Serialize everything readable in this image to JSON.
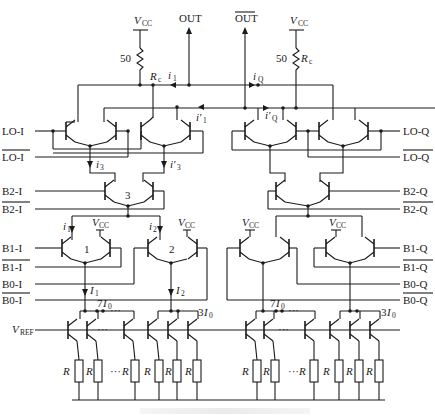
{
  "diagram": {
    "type": "circuit-schematic",
    "supply": {
      "label": "V",
      "sub": "CC"
    },
    "load_resistors": [
      {
        "side": "I",
        "value": "50",
        "name": "R",
        "sub": "c"
      },
      {
        "side": "Q",
        "value": "50",
        "name": "R",
        "sub": "c"
      }
    ],
    "outputs": {
      "out": "OUT",
      "out_bar": "OUT"
    },
    "currents": {
      "i1": {
        "base": "i",
        "sub": "1"
      },
      "i1p": {
        "base": "i′",
        "sub": "1"
      },
      "iQ": {
        "base": "i",
        "sub": "Q"
      },
      "iQp": {
        "base": "i′",
        "sub": "Q"
      },
      "i3": {
        "base": "i",
        "sub": "3"
      },
      "i3p": {
        "base": "i′",
        "sub": "3"
      },
      "i1b": {
        "base": "i",
        "sub": "1"
      },
      "i2b": {
        "base": "i",
        "sub": "2"
      },
      "I1": {
        "base": "I",
        "sub": "1"
      },
      "I2": {
        "base": "I",
        "sub": "2"
      },
      "7I0": {
        "pre": "7",
        "base": "I",
        "sub": "0"
      },
      "3I0": {
        "pre": "3",
        "base": "I",
        "sub": "0"
      }
    },
    "inputs_left": [
      "LO-I",
      "LO-I",
      "B2-I",
      "B2-I",
      "B1-I",
      "B1-I",
      "B0-I",
      "B0-I"
    ],
    "inputs_left_overbar": [
      false,
      true,
      false,
      true,
      false,
      true,
      false,
      true
    ],
    "inputs_right": [
      "LO-Q",
      "LO-Q",
      "B2-Q",
      "B2-Q",
      "B1-Q",
      "B1-Q",
      "B0-Q",
      "B0-Q"
    ],
    "inputs_right_overbar": [
      false,
      true,
      false,
      true,
      false,
      true,
      false,
      true
    ],
    "pair_labels": [
      "1",
      "2",
      "3"
    ],
    "vref": {
      "label": "V",
      "sub": "REF"
    },
    "resistor_label": "R",
    "ellipsis": "···"
  }
}
